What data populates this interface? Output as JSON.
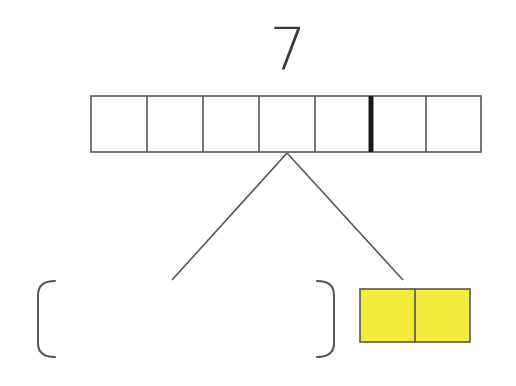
{
  "diagram": {
    "type": "number-bond",
    "whole": {
      "label": "7",
      "cells": 7,
      "marker_after_cell": 5
    },
    "parts": [
      {
        "position": "left",
        "kind": "blank-bracket",
        "value": ""
      },
      {
        "position": "right",
        "kind": "filled-boxes",
        "count": 2,
        "fill_color": "#f4ec3c"
      }
    ],
    "colors": {
      "stroke": "#555555",
      "marker": "#1a1a1a",
      "fill": "#f4ec3c",
      "background": "#ffffff"
    }
  }
}
